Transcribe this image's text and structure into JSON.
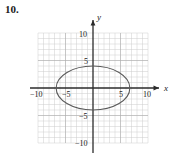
{
  "problem": {
    "number": "10."
  },
  "chart_data": {
    "type": "scatter",
    "title": "",
    "xlabel": "x",
    "ylabel": "y",
    "xlim": [
      -10,
      10
    ],
    "ylim": [
      -10,
      10
    ],
    "grid": true,
    "grid_step": 1,
    "legend": "none",
    "axis_arrows": true,
    "x_tick_labels": [
      "-10",
      "-5",
      "5",
      "10"
    ],
    "x_tick_values": [
      -10,
      -5,
      5,
      10
    ],
    "y_tick_labels": [
      "10",
      "5",
      "-5",
      "-10"
    ],
    "y_tick_values": [
      10,
      5,
      -5,
      -10
    ],
    "curves": [
      {
        "name": "ellipse",
        "shape": "ellipse",
        "center": [
          0,
          0
        ],
        "semi_axis_x": 6.7,
        "semi_axis_y": 4.0,
        "color": "#5a5a5a",
        "linewidth": 1.1,
        "fill": "none"
      }
    ],
    "annotations": []
  },
  "colors": {
    "grid_line": "#c9c9c9",
    "grid_major": "#b0b0b0",
    "axis": "#2b2b2b",
    "curve": "#5a5a5a",
    "text": "#1a1a1a",
    "background": "#ffffff"
  },
  "axis_labels": {
    "x": "x",
    "y": "y"
  }
}
